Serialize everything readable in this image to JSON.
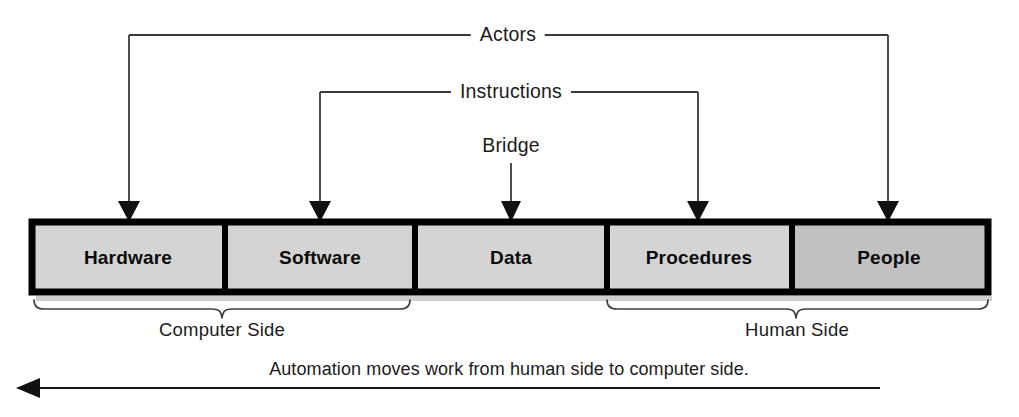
{
  "diagram": {
    "title_text_present": false,
    "components": [
      {
        "label": "Hardware",
        "shade": "light"
      },
      {
        "label": "Software",
        "shade": "light"
      },
      {
        "label": "Data",
        "shade": "light"
      },
      {
        "label": "Procedures",
        "shade": "light"
      },
      {
        "label": "People",
        "shade": "dark"
      }
    ],
    "connectors": [
      {
        "label": "Actors",
        "targets": [
          "Hardware",
          "People"
        ]
      },
      {
        "label": "Instructions",
        "targets": [
          "Software",
          "Procedures"
        ]
      },
      {
        "label": "Bridge",
        "targets": [
          "Data"
        ]
      }
    ],
    "groups": [
      {
        "label": "Computer Side",
        "covers": [
          "Hardware",
          "Software"
        ]
      },
      {
        "label": "Human Side",
        "covers": [
          "Procedures",
          "People"
        ]
      }
    ],
    "caption": "Automation moves work from human side to computer side.",
    "caption_arrow_direction": "left"
  },
  "colors": {
    "cell_light": "#d4d4d4",
    "cell_dark": "#c1c1c1",
    "border": "#000000",
    "line": "#3a3a3a",
    "text": "#1b1b1b"
  }
}
